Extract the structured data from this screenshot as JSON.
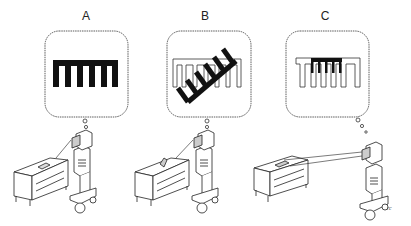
{
  "panels": [
    {
      "label": "A",
      "thought": "solid comb (pattern perceived directly)"
    },
    {
      "label": "B",
      "thought": "tilted comb overlaid on outline pattern"
    },
    {
      "label": "C",
      "thought": "comb matched into outline pattern"
    }
  ],
  "signature": "rc",
  "colors": {
    "ink": "#1a1a1a",
    "background": "#ffffff"
  }
}
